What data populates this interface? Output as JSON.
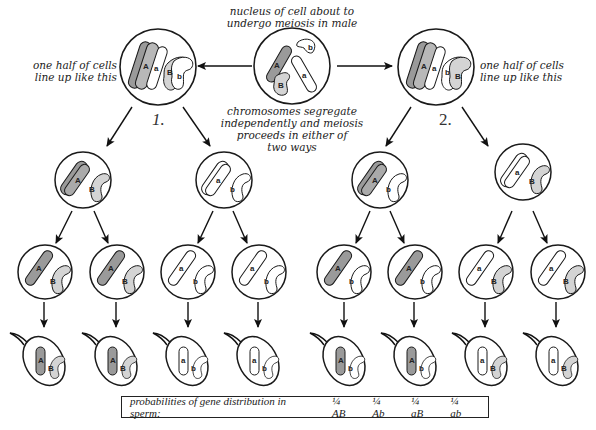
{
  "labels": {
    "top": [
      "nucleus of cell about to",
      "undergo meiosis in male"
    ],
    "segregate": [
      "chromosomes segregate",
      "independently and meiosis",
      "proceeds in either of",
      "two ways"
    ],
    "left_lineup": [
      "one half of cells",
      "line up like this"
    ],
    "right_lineup": [
      "one half of cells",
      "line up like this"
    ],
    "way1": "1.",
    "way2": "2."
  },
  "alleles": {
    "A": "A",
    "a": "a",
    "B": "B",
    "b": "b"
  },
  "probabilities": {
    "title": "probabilities of gene distribution in sperm:",
    "items": [
      "¼ AB",
      "¼ Ab",
      "¼ aB",
      "¼ ab"
    ]
  },
  "colors": {
    "dark_chromosome": "#9a9a9a",
    "light_chromosome": "#d4d4d4",
    "outline": "#1a1a1a"
  },
  "sperm_genotypes": [
    "AB",
    "AB",
    "ab",
    "ab",
    "Ab",
    "Ab",
    "aB",
    "aB"
  ]
}
